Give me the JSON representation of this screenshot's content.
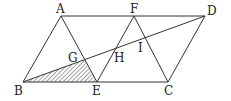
{
  "diagram": {
    "points": {
      "A": {
        "label": "A",
        "x": 61,
        "y": 16,
        "lx": 56,
        "ly": 13
      },
      "F": {
        "label": "F",
        "x": 134,
        "y": 16,
        "lx": 130,
        "ly": 13
      },
      "D": {
        "label": "D",
        "x": 205,
        "y": 16,
        "lx": 207,
        "ly": 15
      },
      "B": {
        "label": "B",
        "x": 23,
        "y": 82,
        "lx": 14,
        "ly": 95
      },
      "E": {
        "label": "E",
        "x": 97,
        "y": 82,
        "lx": 92,
        "ly": 95
      },
      "C": {
        "label": "C",
        "x": 168,
        "y": 82,
        "lx": 164,
        "ly": 95
      },
      "G": {
        "label": "G",
        "x": 84,
        "y": 60,
        "lx": 68,
        "ly": 62
      },
      "H": {
        "label": "H",
        "x": 115,
        "y": 49,
        "lx": 114,
        "ly": 62
      },
      "I": {
        "label": "I",
        "x": 142,
        "y": 37,
        "lx": 138,
        "ly": 52
      }
    },
    "segments": [
      "AD",
      "BC",
      "AB",
      "AE",
      "FE",
      "FC",
      "DC",
      "BD"
    ],
    "shaded_region": [
      "B",
      "E",
      "G"
    ]
  }
}
